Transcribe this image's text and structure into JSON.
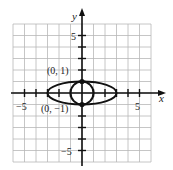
{
  "chart_data": {
    "type": "line",
    "title": "",
    "xlabel": "x",
    "ylabel": "y",
    "xlim": [
      -6,
      6
    ],
    "ylim": [
      -6,
      6
    ],
    "grid": true,
    "x_tick_labels": [
      "-5",
      "5"
    ],
    "y_tick_labels": [
      "5",
      "-5"
    ],
    "x_ticks": [
      -5,
      -4,
      -3,
      -2,
      -1,
      1,
      2,
      3,
      4,
      5
    ],
    "y_ticks": [
      -5,
      -4,
      -3,
      -2,
      -1,
      1,
      2,
      3,
      4,
      5
    ],
    "series": [
      {
        "name": "ellipse",
        "shape": "ellipse",
        "center": [
          0,
          0
        ],
        "rx": 3,
        "ry": 1
      },
      {
        "name": "circle",
        "shape": "circle",
        "center": [
          0,
          0
        ],
        "r": 1
      }
    ],
    "points": [
      {
        "x": 0,
        "y": 1,
        "label": "(0, 1)"
      },
      {
        "x": 0,
        "y": -1,
        "label": "(0, −1)"
      }
    ],
    "colors": {
      "grid": "#b8b8b8",
      "axis": "#111111",
      "curve": "#111111"
    }
  },
  "labels": {
    "x_axis": "x",
    "y_axis": "y",
    "x_neg5": "−5",
    "x_pos5": "5",
    "y_pos5": "5",
    "y_neg5": "−5",
    "pt_top": "(0, 1)",
    "pt_bottom": "(0, −1)"
  }
}
